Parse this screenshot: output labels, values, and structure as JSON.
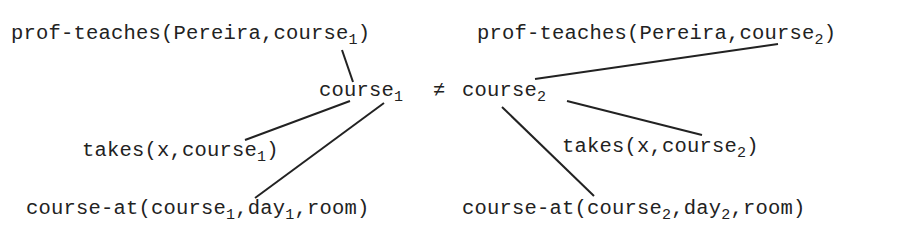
{
  "nodes": {
    "prof_teaches_1": {
      "pre": "prof-teaches(Pereira,course",
      "sub": "1",
      "post": ")"
    },
    "prof_teaches_2": {
      "pre": "prof-teaches(Pereira,course",
      "sub": "2",
      "post": ")"
    },
    "course_1": {
      "pre": "course",
      "sub": "1"
    },
    "neq": {
      "symbol": "≠"
    },
    "course_2": {
      "pre": "course",
      "sub": "2"
    },
    "takes_1": {
      "pre": "takes(x,course",
      "sub": "1",
      "post": ")"
    },
    "takes_2": {
      "pre": "takes(x,course",
      "sub": "2",
      "post": ")"
    },
    "course_at_1": {
      "pre": "course-at(course",
      "sub": "1",
      "mid": ",day",
      "sub2": "1",
      "post": ",room)"
    },
    "course_at_2": {
      "pre": "course-at(course",
      "sub": "2",
      "mid": ",day",
      "sub2": "2",
      "post": ",room)"
    }
  },
  "edges": [
    {
      "from": "prof_teaches_1",
      "to": "course_1"
    },
    {
      "from": "course_1",
      "to": "takes_1"
    },
    {
      "from": "course_1",
      "to": "course_at_1"
    },
    {
      "from": "course_2",
      "to": "prof_teaches_2"
    },
    {
      "from": "course_2",
      "to": "takes_2"
    },
    {
      "from": "course_2",
      "to": "course_at_2"
    }
  ]
}
